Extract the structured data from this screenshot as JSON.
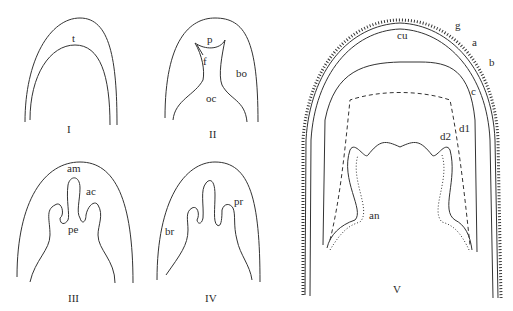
{
  "figure": {
    "panels": [
      {
        "id": "I",
        "numeral": "I",
        "labels": {
          "t": "t"
        }
      },
      {
        "id": "II",
        "numeral": "II",
        "labels": {
          "p": "p",
          "f": "f",
          "bo": "bo",
          "oc": "oc"
        }
      },
      {
        "id": "III",
        "numeral": "III",
        "labels": {
          "am": "am",
          "ac": "ac",
          "pe": "pe"
        }
      },
      {
        "id": "IV",
        "numeral": "IV",
        "labels": {
          "pr": "pr",
          "br": "br"
        }
      },
      {
        "id": "V",
        "numeral": "V",
        "labels": {
          "g": "g",
          "a": "a",
          "b": "b",
          "cu": "cu",
          "c": "c",
          "d1": "d1",
          "d2": "d2",
          "an": "an"
        }
      }
    ],
    "stroke_color": "#333333"
  }
}
